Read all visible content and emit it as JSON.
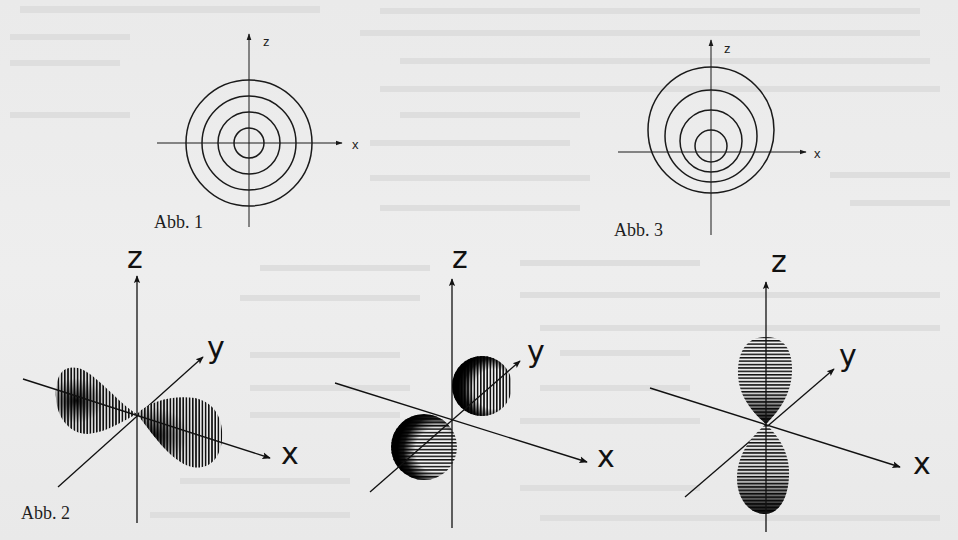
{
  "page": {
    "background_color": "#ebebeb",
    "ink_color": "#1a1a1a"
  },
  "figures": {
    "abb1": {
      "caption": "Abb. 1",
      "description": "Concentric circles in the x-z plane (s-orbital cross-section)",
      "axes": {
        "vertical": "z",
        "horizontal": "x"
      },
      "circle_count": 4
    },
    "abb3": {
      "caption": "Abb. 3",
      "description": "Concentric circles in the x-z plane, slightly offset centers",
      "axes": {
        "vertical": "z",
        "horizontal": "x"
      },
      "circle_count": 4
    },
    "abb2": {
      "caption": "Abb. 2",
      "panels": [
        {
          "name": "p_x orbital",
          "axes": {
            "z": "z",
            "y": "y",
            "x": "x"
          },
          "lobe_axis": "x"
        },
        {
          "name": "p_y orbital",
          "axes": {
            "z": "z",
            "y": "y",
            "x": "x"
          },
          "lobe_axis": "y"
        },
        {
          "name": "p_z orbital",
          "axes": {
            "z": "z",
            "y": "y",
            "x": "x"
          },
          "lobe_axis": "z"
        }
      ]
    }
  }
}
